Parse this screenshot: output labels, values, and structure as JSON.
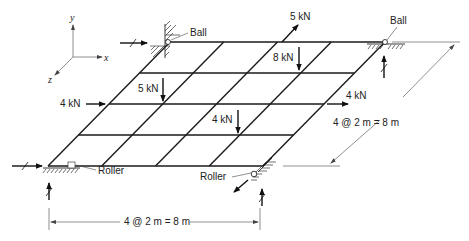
{
  "diagram": {
    "type": "grid-structure",
    "axes": {
      "x": "x",
      "y": "y",
      "z": "z"
    },
    "grid": {
      "columns": 4,
      "rows": 4
    },
    "loads": [
      {
        "id": "load_5kN_inplane",
        "label": "5 kN",
        "direction": "in-plane diagonal"
      },
      {
        "id": "load_8kN",
        "label": "8 kN",
        "direction": "down"
      },
      {
        "id": "load_5kN_down",
        "label": "5 kN",
        "direction": "down"
      },
      {
        "id": "load_4kN_left",
        "label": "4 kN",
        "direction": "right"
      },
      {
        "id": "load_4kN_right",
        "label": "4 kN",
        "direction": "right"
      },
      {
        "id": "load_4kN_down",
        "label": "4 kN",
        "direction": "down"
      }
    ],
    "supports": {
      "ball_top_left": "Ball",
      "ball_top_right": "Ball",
      "roller_bottom_left": "Roller",
      "roller_bottom_right": "Roller"
    },
    "dimensions": {
      "horizontal": "4 @ 2 m = 8 m",
      "depth": "4 @ 2 m = 8 m"
    }
  }
}
